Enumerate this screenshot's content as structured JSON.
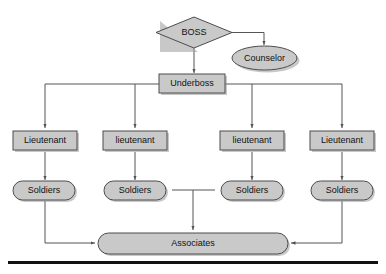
{
  "diagram": {
    "type": "flowchart",
    "background_color": "#ffffff",
    "node_fill": "#c9c9c9",
    "node_stroke": "#4d4d4d",
    "edge_color": "#555555",
    "label_color": "#111111",
    "nodes": {
      "boss": {
        "label": "BOSS",
        "shape": "diamond"
      },
      "counselor": {
        "label": "Counselor",
        "shape": "ellipse"
      },
      "underboss": {
        "label": "Underboss",
        "shape": "rectangle"
      },
      "lieutenant_1": {
        "label": "Lieutenant",
        "shape": "rectangle"
      },
      "lieutenant_2": {
        "label": "lieutenant",
        "shape": "rectangle"
      },
      "lieutenant_3": {
        "label": "lieutenant",
        "shape": "rectangle"
      },
      "lieutenant_4": {
        "label": "Lieutenant",
        "shape": "rectangle"
      },
      "soldiers_1": {
        "label": "Soldiers",
        "shape": "stadium"
      },
      "soldiers_2": {
        "label": "Soldiers",
        "shape": "stadium"
      },
      "soldiers_3": {
        "label": "Soldiers",
        "shape": "stadium"
      },
      "soldiers_4": {
        "label": "Soldiers",
        "shape": "stadium"
      },
      "associates": {
        "label": "Associates",
        "shape": "stadium"
      }
    },
    "edges": [
      {
        "from": "boss",
        "to": "underboss"
      },
      {
        "from": "boss",
        "to": "counselor"
      },
      {
        "from": "underboss",
        "to": "lieutenant_1"
      },
      {
        "from": "underboss",
        "to": "lieutenant_2"
      },
      {
        "from": "underboss",
        "to": "lieutenant_3"
      },
      {
        "from": "underboss",
        "to": "lieutenant_4"
      },
      {
        "from": "lieutenant_1",
        "to": "soldiers_1"
      },
      {
        "from": "lieutenant_2",
        "to": "soldiers_2"
      },
      {
        "from": "lieutenant_3",
        "to": "soldiers_3"
      },
      {
        "from": "lieutenant_4",
        "to": "soldiers_4"
      },
      {
        "from": "soldiers_1",
        "to": "associates"
      },
      {
        "from": "soldiers_2",
        "to": "associates"
      },
      {
        "from": "soldiers_3",
        "to": "associates"
      },
      {
        "from": "soldiers_4",
        "to": "associates"
      }
    ]
  }
}
